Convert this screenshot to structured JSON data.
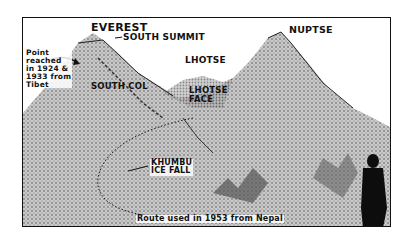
{
  "illustration": {
    "description": "Stippled illustration of Everest, Lhotse and Nuptse with route labels",
    "labels": {
      "everest": "EVEREST",
      "south_summit": "SOUTH SUMMIT",
      "nuptse": "NUPTSE",
      "lhotse": "LHOTSE",
      "point_reached": "Point\nreached\nin 1924 &\n1933 from\nTibet",
      "south_col": "SOUTH COL",
      "lhotse_face": "LHOTSE\nFACE",
      "khumbu_ice_fall": "KHUMBU\nICE FALL",
      "route": "Route used in 1953 from Nepal"
    },
    "colors": {
      "ink": "#111111",
      "paper": "#ffffff",
      "stipple": "#8a8a8a"
    }
  }
}
